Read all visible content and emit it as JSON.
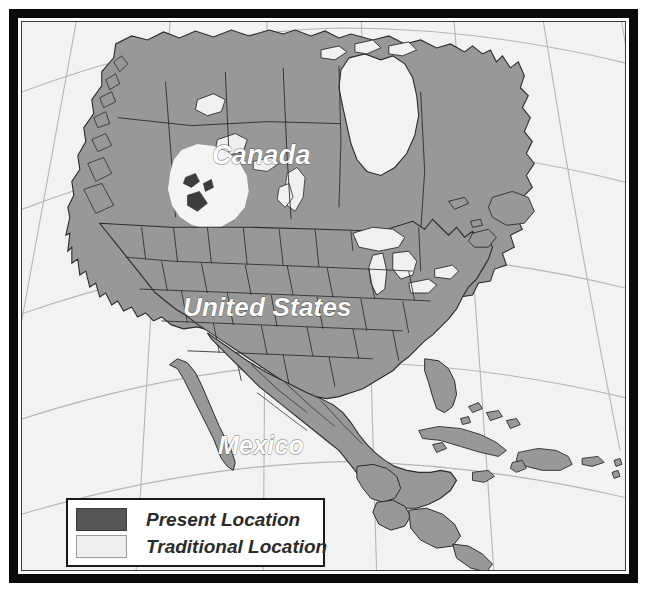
{
  "figure": {
    "type": "thematic-map",
    "region": "North America",
    "projection": "conic",
    "frame_color": "#0a0a0a",
    "background_color": "#ffffff"
  },
  "map": {
    "ocean_color": "#f2f2f2",
    "land_color": "#989898",
    "border_color": "#2b2b2b",
    "graticule_color": "#b0b0b0",
    "lake_color": "#f0f0f0",
    "present_location_color": "#565656",
    "traditional_location_color": "#f4f4f4",
    "labels": [
      {
        "name": "canada",
        "text": "Canada"
      },
      {
        "name": "united-states",
        "text": "United States"
      },
      {
        "name": "mexico",
        "text": "Mexico"
      }
    ]
  },
  "legend": {
    "items": [
      {
        "key": "present",
        "label": "Present Location",
        "color": "#565656"
      },
      {
        "key": "traditional",
        "label": "Traditional Location",
        "color": "#eeeeee"
      }
    ]
  }
}
